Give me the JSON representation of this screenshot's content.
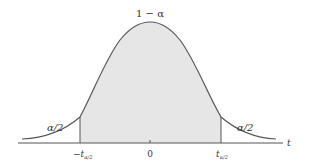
{
  "diagram": {
    "type": "t-distribution two-tailed critical region",
    "labels": {
      "center_area": "1 − α",
      "left_tail_area": "α/2",
      "right_tail_area": "α/2",
      "left_critical": "−t",
      "left_critical_sub": "α/2",
      "right_critical": "t",
      "right_critical_sub": "α/2",
      "center_tick": "0",
      "axis_variable": "t"
    },
    "colors": {
      "shaded_region": "#e6e6e6",
      "curve": "#555555",
      "axis": "#555555",
      "background": "#ffffff"
    }
  }
}
